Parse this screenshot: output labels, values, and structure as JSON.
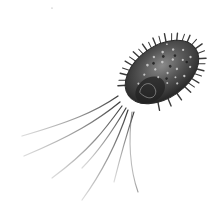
{
  "image": {
    "subject": "spiky bacterium with flagella",
    "style": "grayscale",
    "background": "#ffffff",
    "colors": {
      "body_dark": "#2e2e2e",
      "body_mid": "#5a5a5a",
      "speckle": "#bdbdbd",
      "spine": "#3a3a3a",
      "flagellum": "#4a4a4a"
    }
  }
}
